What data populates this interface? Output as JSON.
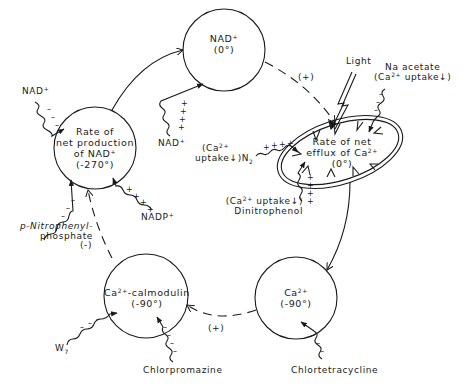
{
  "nodes": {
    "nad_phase": {
      "line1": "NAD",
      "sup1": "+",
      "line2": "(0°)"
    },
    "nad_rate": {
      "line1": "Rate of",
      "line2": "net production",
      "line3": "of NAD",
      "sup3": "+",
      "line4": "(-270°)"
    },
    "ca_efflux": {
      "line1": "Rate of net",
      "line2": "efflux of Ca",
      "sup2": "2+",
      "line3": "(0°)"
    },
    "ca_calmodulin": {
      "line1a": "Ca",
      "sup1": "2+",
      "line1b": "-calmodulin",
      "line2": "(-90°)"
    },
    "ca_phase": {
      "line1": "Ca",
      "sup1": "2+",
      "line2": "(-90°)"
    }
  },
  "edges": {
    "nad_to_efflux_sign": "(+)",
    "calmodulin_to_nadrate_sign": "(-)",
    "ca_to_calmodulin_sign": "(+)"
  },
  "effectors": {
    "nad_into_rate": {
      "text": "NAD",
      "sup": "+",
      "sign": "-"
    },
    "nadp": {
      "text": "NADP",
      "sup": "+",
      "sign": "+"
    },
    "pnpp": {
      "line1": "p-Nitrophenyl-",
      "line2": "phosphate",
      "sign": "-"
    },
    "nad_into_nad": {
      "text": "NAD",
      "sup": "+",
      "sign": "+"
    },
    "light": {
      "text": "Light"
    },
    "na_acetate": {
      "line1": "Na acetate",
      "line2a": "(Ca",
      "sup2": "2+",
      "line2b": " uptake↓)",
      "sign": "-"
    },
    "n2": {
      "line1a": "(Ca",
      "sup1": "2+",
      "line2": "uptake↓)N",
      "sub2": "2",
      "sign": "+"
    },
    "dnp": {
      "line1a": "(Ca",
      "sup1": "2+",
      "line1b": " uptake↓)",
      "line2": "Dinitrophenol",
      "sign": "+"
    },
    "w7": {
      "text": "W",
      "sub": "7",
      "sign": "-"
    },
    "chlorpromazine": {
      "text": "Chlorpromazine",
      "sign": "-"
    },
    "chlortetracycline": {
      "text": "Chlortetracycline",
      "sign": "-"
    }
  },
  "colors": {
    "ink": "#1a1a1a",
    "background": "#ffffff"
  }
}
